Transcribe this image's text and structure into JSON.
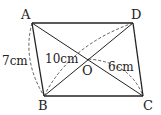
{
  "diagram": {
    "type": "parallelogram with diagonals",
    "vertices": {
      "A": {
        "label": "A",
        "x": 32,
        "y": 23
      },
      "D": {
        "label": "D",
        "x": 133,
        "y": 23
      },
      "B": {
        "label": "B",
        "x": 44,
        "y": 96
      },
      "C": {
        "label": "C",
        "x": 143,
        "y": 96
      },
      "O": {
        "label": "O",
        "x": 88,
        "y": 59
      }
    },
    "measurements": {
      "AB": "7cm",
      "BD": "10cm",
      "OC": "6cm"
    },
    "colors": {
      "stroke": "#222222",
      "background": "#ffffff"
    }
  }
}
